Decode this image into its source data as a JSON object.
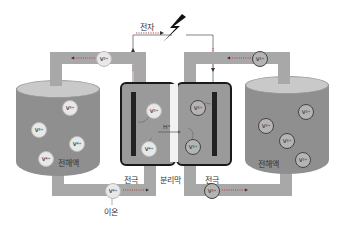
{
  "diagram": {
    "type": "vanadium-redox-flow-battery",
    "labels": {
      "electron": "전자",
      "ion": "이온",
      "electrode_left": "전극",
      "electrode_right": "전극",
      "separator": "분리막",
      "electrolyte_left": "전해액",
      "electrolyte_right": "전해액",
      "proton": "H⁺"
    },
    "ions": {
      "top_left_pipe": "V⁵⁺",
      "top_right_pipe": "V²⁺",
      "bottom_left_pipe": "V⁴⁺",
      "bottom_right_pipe": "V³⁺",
      "left_tank": [
        "V⁵⁺",
        "V⁵⁺",
        "V⁴⁺",
        "V⁴⁺"
      ],
      "right_tank": [
        "V²⁺",
        "V³⁺",
        "V²⁺",
        "V³⁺"
      ],
      "cell_left": [
        "V⁵⁺",
        "V⁴⁺"
      ],
      "cell_right": [
        "V²⁺",
        "V³⁺"
      ]
    },
    "colors": {
      "pipe": "#a8a8a8",
      "tank": "#8f8f8f",
      "tank_top": "#c9c9c9",
      "cell": "#9a9a9a",
      "electrode": "#222222",
      "lightning": "#111111"
    }
  }
}
